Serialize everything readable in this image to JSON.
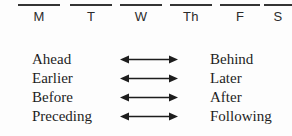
{
  "figure": {
    "background_color": "#fdfdfd",
    "ink_color": "#1d1d1d"
  },
  "day_header": {
    "name": "days-of-week-header",
    "bar_color": "#343434",
    "days": [
      {
        "label": "M",
        "left": 18,
        "width": 42
      },
      {
        "label": "T",
        "left": 70,
        "width": 42
      },
      {
        "label": "W",
        "left": 120,
        "width": 42
      },
      {
        "label": "Th",
        "left": 170,
        "width": 42
      },
      {
        "label": "F",
        "left": 220,
        "width": 40
      },
      {
        "label": "S",
        "left": 266,
        "width": 26
      }
    ]
  },
  "pairs": {
    "name": "opposite-term-pairs",
    "arrow_icon": "double-headed-arrow-icon",
    "rows": [
      {
        "left": "Ahead",
        "right": "Behind"
      },
      {
        "left": "Earlier",
        "right": "Later"
      },
      {
        "left": "Before",
        "right": "After"
      },
      {
        "left": "Preceding",
        "right": "Following"
      }
    ]
  }
}
